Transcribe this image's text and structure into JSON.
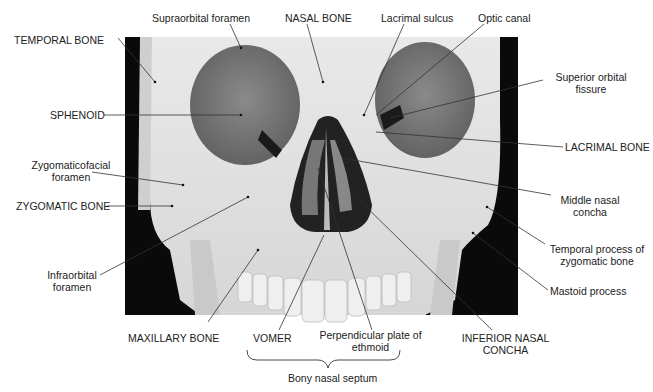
{
  "figure": {
    "labels": {
      "supraorbital_foramen": "Supraorbital foramen",
      "nasal_bone": "NASAL BONE",
      "lacrimal_sulcus": "Lacrimal sulcus",
      "optic_canal": "Optic canal",
      "temporal_bone": "TEMPORAL BONE",
      "superior_orbital_fissure_1": "Superior orbital",
      "superior_orbital_fissure_2": "fissure",
      "sphenoid": "SPHENOID",
      "lacrimal_bone": "LACRIMAL BONE",
      "zygomaticofacial_1": "Zygomaticofacial",
      "zygomaticofacial_2": "foramen",
      "middle_nasal_concha_1": "Middle nasal",
      "middle_nasal_concha_2": "concha",
      "zygomatic_bone": "ZYGOMATIC BONE",
      "temporal_process_1": "Temporal process of",
      "temporal_process_2": "zygomatic bone",
      "infraorbital_1": "Infraorbital",
      "infraorbital_2": "foramen",
      "mastoid_process": "Mastoid process",
      "maxillary_bone": "MAXILLARY BONE",
      "vomer": "VOMER",
      "perpendicular_plate_1": "Perpendicular plate of",
      "perpendicular_plate_2": "ethmoid",
      "inferior_nasal_concha_1": "INFERIOR NASAL",
      "inferior_nasal_concha_2": "CONCHA",
      "bony_nasal_septum": "Bony nasal septum"
    }
  }
}
